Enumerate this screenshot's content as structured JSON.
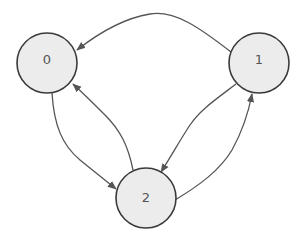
{
  "diagram": {
    "type": "directed-graph",
    "colors": {
      "node_fill": "#ececec",
      "node_stroke": "#3a3a3a",
      "edge": "#555555",
      "label": "#555555",
      "background": "#ffffff"
    },
    "nodes": [
      {
        "id": "0",
        "label": "0",
        "cx": 47,
        "cy": 63,
        "r": 30
      },
      {
        "id": "1",
        "label": "1",
        "cx": 259,
        "cy": 63,
        "r": 30
      },
      {
        "id": "2",
        "label": "2",
        "cx": 146,
        "cy": 198,
        "r": 30
      }
    ],
    "edges": [
      {
        "from": "1",
        "to": "0"
      },
      {
        "from": "0",
        "to": "2"
      },
      {
        "from": "2",
        "to": "0"
      },
      {
        "from": "1",
        "to": "2"
      },
      {
        "from": "2",
        "to": "1"
      }
    ]
  }
}
